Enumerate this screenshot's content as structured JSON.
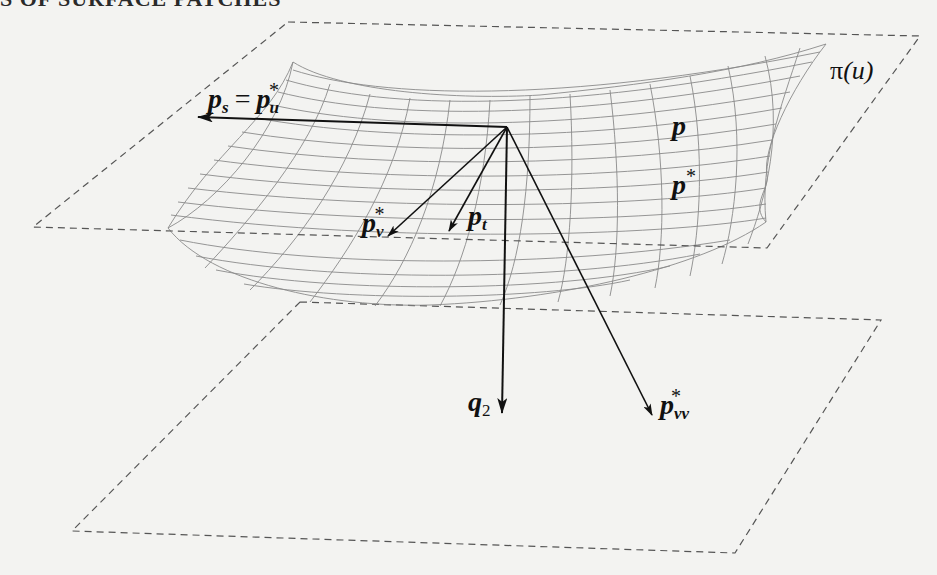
{
  "header": {
    "running_title_visible": "S OF SURFACE PATCHES"
  },
  "figure": {
    "type": "surface-patch-diagram",
    "colors": {
      "background": "#f3f3f1",
      "vectors": "#111111",
      "mesh": "#8a8a8a",
      "planes": "#555555"
    },
    "planes": [
      {
        "name": "upper-plane",
        "label": "π(u)",
        "corners": [
          [
            288,
            22
          ],
          [
            920,
            36
          ],
          [
            767,
            248
          ],
          [
            33,
            227
          ]
        ]
      },
      {
        "name": "lower-plane",
        "label": "",
        "corners": [
          [
            300,
            302
          ],
          [
            881,
            320
          ],
          [
            735,
            553
          ],
          [
            72,
            531
          ]
        ]
      }
    ],
    "origin": [
      507,
      127
    ],
    "vectors": [
      {
        "name": "p_s",
        "tip": [
          197,
          117
        ]
      },
      {
        "name": "p_v_star",
        "tip": [
          388,
          236
        ]
      },
      {
        "name": "p_t",
        "tip": [
          449,
          231
        ]
      },
      {
        "name": "q_2",
        "tip": [
          502,
          413
        ]
      },
      {
        "name": "p_vv_star",
        "tip": [
          652,
          415
        ]
      }
    ],
    "labels": {
      "ps_main": "p",
      "ps_sub": "s",
      "equals": "=",
      "pu_main": "p",
      "pu_sub": "u",
      "pu_sup": "*",
      "pv_main": "p",
      "pv_sub": "v",
      "pv_sup": "*",
      "pt_main": "p",
      "pt_sub": "t",
      "q2_main": "q",
      "q2_sub": "2",
      "pvv_main": "p",
      "pvv_sub": "vv",
      "pvv_sup": "*",
      "p_curve": "p",
      "pstar_main": "p",
      "pstar_sup": "*",
      "pi_sym": "π",
      "pi_arg": "(u)"
    }
  }
}
